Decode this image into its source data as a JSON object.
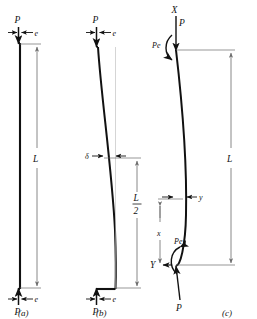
{
  "figure": {
    "background_color": "#ffffff",
    "ink_color": "#111111",
    "dimension_color": "#6b6b6b",
    "panels": [
      {
        "caption": "(a)",
        "description": "Straight undeformed column with eccentric axial load",
        "labels": {
          "load_top": "P",
          "eccentricity_top": "e",
          "length": "L",
          "load_bottom": "P",
          "eccentricity_bottom": "e"
        }
      },
      {
        "caption": "(b)",
        "description": "Deflected column showing midspan deflection",
        "labels": {
          "load_top": "P",
          "eccentricity_top": "e",
          "deflection": "δ",
          "half_length_numerator": "L",
          "half_length_denominator": "2",
          "load_bottom": "P",
          "eccentricity_bottom": "e"
        }
      },
      {
        "caption": "(c)",
        "description": "Free body with coordinate axes and end moments",
        "labels": {
          "axis_vertical": "X",
          "load_top": "P",
          "moment_top": "Pe",
          "length": "L",
          "deflection_y": "y",
          "distance_x": "x",
          "moment_bottom": "Pe",
          "axis_horizontal": "Y",
          "load_bottom": "P"
        }
      }
    ]
  }
}
